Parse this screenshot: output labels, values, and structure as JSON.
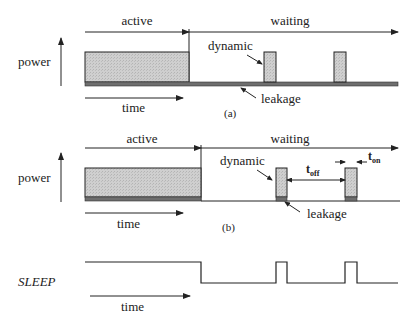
{
  "figure": {
    "panel_a": {
      "caption": "(a)",
      "phase_active": "active",
      "phase_waiting": "waiting",
      "y_axis_label": "power",
      "x_axis_label": "time",
      "dynamic_label": "dynamic",
      "leakage_label": "leakage"
    },
    "panel_b": {
      "caption": "(b)",
      "phase_active": "active",
      "phase_waiting": "waiting",
      "y_axis_label": "power",
      "x_axis_label": "time",
      "dynamic_label": "dynamic",
      "leakage_label": "leakage",
      "t_off_base": "t",
      "t_off_sub": "off",
      "t_on_base": "t",
      "t_on_sub": "on"
    },
    "sleep_signal": {
      "label": "SLEEP",
      "x_axis_label": "time"
    }
  },
  "colors": {
    "dynamic_fill": "#c8c8c8",
    "leakage_fill": "#6e6e6e",
    "stroke": "#222222"
  }
}
